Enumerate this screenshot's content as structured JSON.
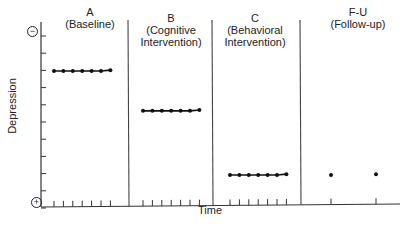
{
  "chart_data": {
    "type": "line",
    "title": "",
    "xlabel": "Time",
    "ylabel": "Depression",
    "y_axis_markers": {
      "top": "−",
      "bottom": "+"
    },
    "y_ticks_count": 11,
    "grid": false,
    "legend": null,
    "phases": [
      {
        "id": "A",
        "name": "(Baseline)",
        "lines": [
          "A",
          "(Baseline)"
        ],
        "sessions": 7,
        "level": 8
      },
      {
        "id": "B",
        "name": "(Cognitive Intervention)",
        "lines": [
          "B",
          "(Cognitive",
          "Intervention)"
        ],
        "sessions": 7,
        "level": 5.7
      },
      {
        "id": "C",
        "name": "(Behavioral Intervention)",
        "lines": [
          "C",
          "(Behavioral",
          "Intervention)"
        ],
        "sessions": 7,
        "level": 2
      },
      {
        "id": "F-U",
        "name": "(Follow-up)",
        "lines": [
          "F-U",
          "(Follow-up)"
        ],
        "sessions": 2,
        "level": 2
      }
    ],
    "series": [
      {
        "name": "A (Baseline)",
        "values": [
          8,
          8,
          8,
          8,
          8,
          8,
          8.05
        ],
        "connected": true
      },
      {
        "name": "B (Cognitive Intervention)",
        "values": [
          5.7,
          5.7,
          5.7,
          5.7,
          5.7,
          5.7,
          5.75
        ],
        "connected": true
      },
      {
        "name": "C (Behavioral Intervention)",
        "values": [
          2,
          2,
          2,
          2,
          2,
          2,
          2.05
        ],
        "connected": true
      },
      {
        "name": "F-U (Follow-up)",
        "values": [
          2,
          2.05
        ],
        "connected": false
      }
    ],
    "ylim": [
      0,
      10.5
    ],
    "y_direction_note": "higher = more depression (top marked minus, bottom marked plus)"
  },
  "labels": {
    "xlabel": "Time",
    "ylabel": "Depression",
    "top_marker": "−",
    "bottom_marker": "+",
    "phaseA_1": "A",
    "phaseA_2": "(Baseline)",
    "phaseB_1": "B",
    "phaseB_2": "(Cognitive",
    "phaseB_3": "Intervention)",
    "phaseC_1": "C",
    "phaseC_2": "(Behavioral",
    "phaseC_3": "Intervention)",
    "phaseF_1": "F-U",
    "phaseF_2": "(Follow-up)"
  }
}
